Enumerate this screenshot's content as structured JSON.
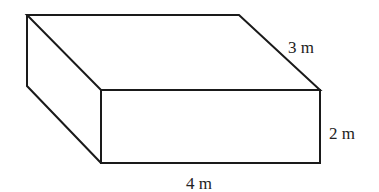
{
  "figure": {
    "type": "rectangular-prism",
    "dimensions": {
      "length": {
        "value": 4,
        "unit": "m",
        "label": "4 m"
      },
      "width": {
        "value": 3,
        "unit": "m",
        "label": "3 m"
      },
      "height": {
        "value": 2,
        "unit": "m",
        "label": "2 m"
      }
    },
    "colors": {
      "stroke": "#1a1a1a",
      "background": "#ffffff",
      "text": "#222222"
    }
  }
}
